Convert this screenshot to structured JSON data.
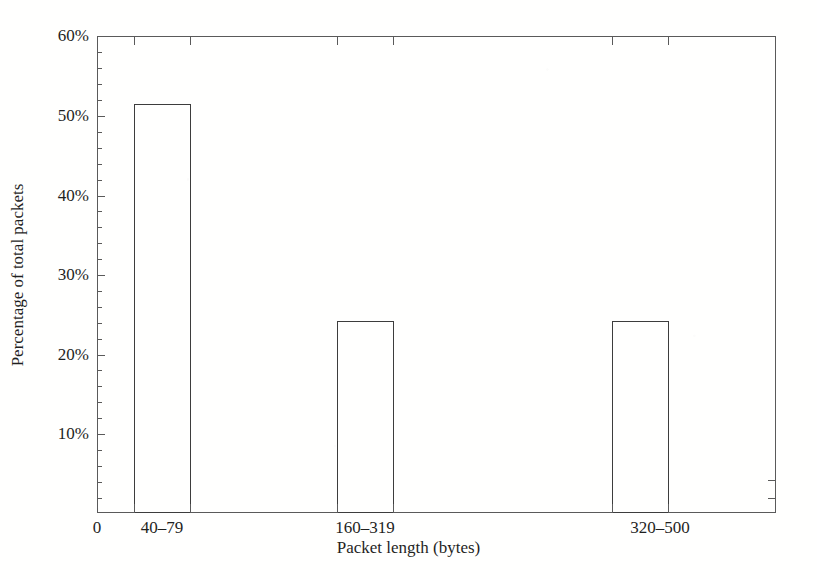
{
  "chart_data": {
    "type": "bar",
    "title": "",
    "subtitle": "",
    "xlabel": "Packet length (bytes)",
    "ylabel": "Percentage of total packets",
    "categories": [
      "40–79",
      "160–319",
      "320–500"
    ],
    "values": [
      51.5,
      24.2,
      24.2
    ],
    "value_unit": "%",
    "ylim": [
      0,
      60
    ],
    "y_major_ticks": [
      0,
      10,
      20,
      30,
      40,
      50,
      60
    ],
    "y_tick_labels": [
      "",
      "10%",
      "20%",
      "30%",
      "40%",
      "50%",
      "60%"
    ],
    "y_minor_tick_step": 2,
    "x_origin_label": "0",
    "grid": false,
    "legend": null,
    "bar_fill": "none",
    "bar_edge_color": "#3d3d3d",
    "frame_color": "#5a5a5a",
    "background_color": "#ffffff",
    "text_color": "#1f1f1f"
  },
  "axes": {
    "y_labels": [
      {
        "text": "60%",
        "value": 60
      },
      {
        "text": "50%",
        "value": 50
      },
      {
        "text": "40%",
        "value": 40
      },
      {
        "text": "30%",
        "value": 30
      },
      {
        "text": "20%",
        "value": 20
      },
      {
        "text": "10%",
        "value": 10
      }
    ],
    "x_labels": [
      {
        "text": "0"
      },
      {
        "text": "40–79"
      },
      {
        "text": "160–319"
      },
      {
        "text": "320–500"
      }
    ]
  }
}
